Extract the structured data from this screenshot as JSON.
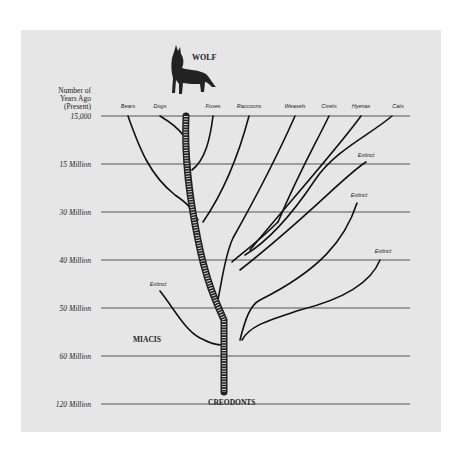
{
  "diagram": {
    "title": "WOLF",
    "root_label": "CREODONTS",
    "ancestor_label": "MIACIS",
    "axis_title": [
      "Number of",
      "Years Ago",
      "(Present)"
    ],
    "time_marks": [
      {
        "label": "15,000",
        "y": 116
      },
      {
        "label": "15 Million",
        "y": 164
      },
      {
        "label": "30 Million",
        "y": 212
      },
      {
        "label": "40 Million",
        "y": 260
      },
      {
        "label": "50 Million",
        "y": 308
      },
      {
        "label": "60 Million",
        "y": 356
      },
      {
        "label": "120 Million",
        "y": 404
      }
    ],
    "species": [
      {
        "label": "Bears",
        "x": 128
      },
      {
        "label": "Dogs",
        "x": 160
      },
      {
        "label": "Foxes",
        "x": 213
      },
      {
        "label": "Raccoons",
        "x": 249
      },
      {
        "label": "Weasels",
        "x": 295
      },
      {
        "label": "Civets",
        "x": 329
      },
      {
        "label": "Hyenas",
        "x": 361
      },
      {
        "label": "Cats",
        "x": 398
      }
    ],
    "extinct_labels": [
      {
        "label": "Extinct",
        "x": 366,
        "y": 157
      },
      {
        "label": "Extinct",
        "x": 359,
        "y": 197
      },
      {
        "label": "Extinct",
        "x": 383,
        "y": 253
      },
      {
        "label": "Extinct",
        "x": 158,
        "y": 286
      }
    ],
    "colors": {
      "background": "#e6e6e6",
      "line": "#111111",
      "rule": "#555555"
    }
  }
}
